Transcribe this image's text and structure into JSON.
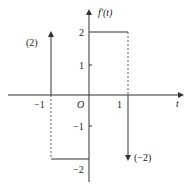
{
  "diagram": {
    "ylabel": "f'(t)",
    "xlabel": "t",
    "origin": "O",
    "x_ticks": [
      "-1",
      "1"
    ],
    "y_ticks": [
      "2",
      "1",
      "-1",
      "-2"
    ],
    "impulses": [
      {
        "x": -1,
        "strength": 2,
        "label": "(2)",
        "direction": "up"
      },
      {
        "x": 1,
        "strength": -2,
        "label": "(−2)",
        "direction": "down"
      }
    ],
    "segments": [
      {
        "from_x": -1,
        "to_x": 0,
        "level": -2
      },
      {
        "from_x": 0,
        "to_x": 1,
        "level": 2
      }
    ],
    "colors": {
      "line": "#333333",
      "background": "#ffffff"
    }
  },
  "labels": {
    "ylabel": "f'(t)",
    "xlabel": "t",
    "origin": "O",
    "x_neg1": "−1",
    "x_pos1": "1",
    "y_2": "2",
    "y_1": "1",
    "y_neg1": "−1",
    "y_neg2": "−2",
    "impulse_up": "(2)",
    "impulse_down": "(−2)"
  }
}
